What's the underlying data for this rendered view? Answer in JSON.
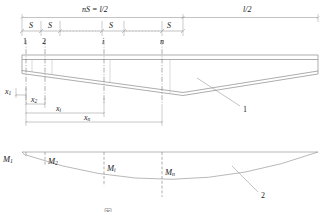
{
  "figure": {
    "kind": "engineering-diagram",
    "title_caption": "图",
    "colors": {
      "line": "#9a9a9a",
      "outline": "#8a8a8a",
      "centerline": "#7a7a7a",
      "text": "#1a1a1a",
      "caption": "#8d8d8d"
    }
  },
  "top_dimensions": {
    "left_span_label": "nS = l/2",
    "right_span_label": "l/2",
    "segment_labels": [
      "S",
      "S",
      "S",
      "S"
    ]
  },
  "stations": {
    "labels": [
      "1",
      "2",
      "i",
      "n"
    ]
  },
  "x_dimensions": {
    "labels": [
      "x",
      "x",
      "x",
      "x"
    ],
    "subscripts": [
      "1",
      "2",
      "i",
      "n"
    ]
  },
  "moment_diagram": {
    "labels": [
      "M",
      "M",
      "M",
      "M"
    ],
    "subscripts": [
      "1",
      "2",
      "i",
      "n"
    ]
  },
  "leaders": [
    {
      "label": "1",
      "target": "beam-profile"
    },
    {
      "label": "2",
      "target": "moment-curve"
    }
  ]
}
